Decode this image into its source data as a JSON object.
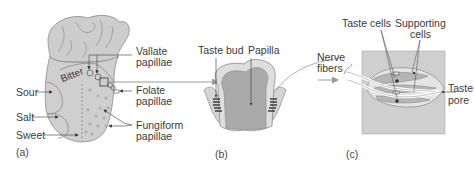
{
  "figure": {
    "panels": [
      {
        "id": "a",
        "label": "(a)",
        "subject": "tongue"
      },
      {
        "id": "b",
        "label": "(b)",
        "subject": "papilla cross-section"
      },
      {
        "id": "c",
        "label": "(c)",
        "subject": "taste bud detail"
      }
    ],
    "tongue": {
      "regions": {
        "bitter": "Bitter",
        "sour": "Sour",
        "salt": "Salt",
        "sweet": "Sweet"
      },
      "papillae": {
        "vallate_line1": "Vallate",
        "vallate_line2": "papillae",
        "folate_line1": "Folate",
        "folate_line2": "papillae",
        "fungiform_line1": "Fungiform",
        "fungiform_line2": "papillae"
      }
    },
    "papilla": {
      "taste_bud": "Taste bud",
      "papilla": "Papilla"
    },
    "taste_bud": {
      "taste_cells": "Taste cells",
      "supporting_line1": "Supporting",
      "supporting_line2": "cells",
      "nerve_line1": "Nerve",
      "nerve_line2": "fibers",
      "pore_line1": "Taste",
      "pore_line2": "pore"
    },
    "colors": {
      "tissue_fill": "#cfcfcf",
      "tissue_dark": "#a9a9a9",
      "outline": "#7a7a7a",
      "text": "#3a3a3a",
      "arrow": "#8a8a8a"
    }
  }
}
